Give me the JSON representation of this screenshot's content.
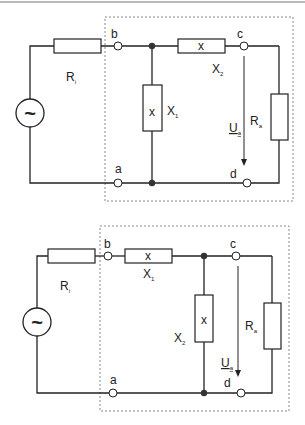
{
  "diagrams": [
    {
      "id": "circuit-1",
      "source_symbol": "~",
      "labels": {
        "ri": "R",
        "ri_sub": "i",
        "x1": "X",
        "x1_sub": "1",
        "x2": "X",
        "x2_sub": "2",
        "ra": "R",
        "ra_sub": "a",
        "ua": "U",
        "ua_sub": "a",
        "b": "b",
        "c": "c",
        "a": "a",
        "d": "d",
        "x_box_1": "x",
        "x_box_2": "x"
      }
    },
    {
      "id": "circuit-2",
      "source_symbol": "~",
      "labels": {
        "ri": "R",
        "ri_sub": "i",
        "x1": "X",
        "x1_sub": "1",
        "x2": "X",
        "x2_sub": "2",
        "ra": "R",
        "ra_sub": "a",
        "ua": "U",
        "ua_sub": "a",
        "b": "b",
        "c": "c",
        "a": "a",
        "d": "d",
        "x_box_1": "x",
        "x_box_2": "x"
      }
    }
  ],
  "colors": {
    "line": "#222222",
    "dotted": "#888888",
    "node": "#333333"
  }
}
